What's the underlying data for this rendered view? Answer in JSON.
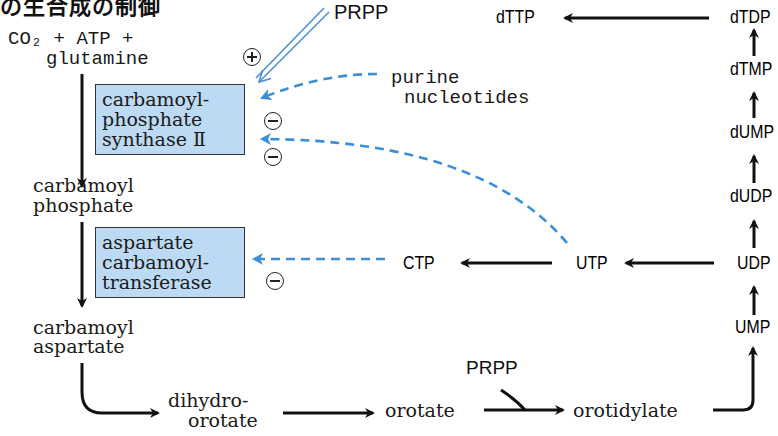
{
  "title_fragment": "の生合成の制御",
  "substrates": {
    "line1": "CO₂ + ATP +",
    "line2": "glutamine"
  },
  "activator": {
    "label": "PRPP",
    "sign": "plus"
  },
  "inhibitors": {
    "purine": {
      "line1": "purine",
      "line2": "nucleotides"
    }
  },
  "enzymes": {
    "cps2": {
      "text": "carbamoyl-\nphosphate\nsynthase Ⅱ",
      "fill": "#bcdaf3"
    },
    "atcase": {
      "text": "aspartate\ncarbamoyl-\ntransferase",
      "fill": "#bcdaf3"
    }
  },
  "intermediates": {
    "carbamoyl_phosphate": {
      "line1": "carbamoyl",
      "line2": "phosphate"
    },
    "carbamoyl_aspartate": {
      "line1": "carbamoyl",
      "line2": "aspartate"
    },
    "dihydroorotate": {
      "line1": "dihydro-",
      "line2": "orotate"
    },
    "orotate": "orotate",
    "orotidylate": "orotidylate",
    "prpp_bottom": "PRPP"
  },
  "nucleotides": {
    "UMP": "UMP",
    "UDP": "UDP",
    "dUDP": "dUDP",
    "dUMP": "dUMP",
    "dTMP": "dTMP",
    "dTDP": "dTDP",
    "dTTP": "dTTP",
    "UTP": "UTP",
    "CTP": "CTP"
  },
  "colors": {
    "arrow_main": "#111111",
    "feedback_blue": "#3a8fd8",
    "activation_blue": "#4a90d9",
    "enzyme_fill": "#bcdaf3"
  }
}
